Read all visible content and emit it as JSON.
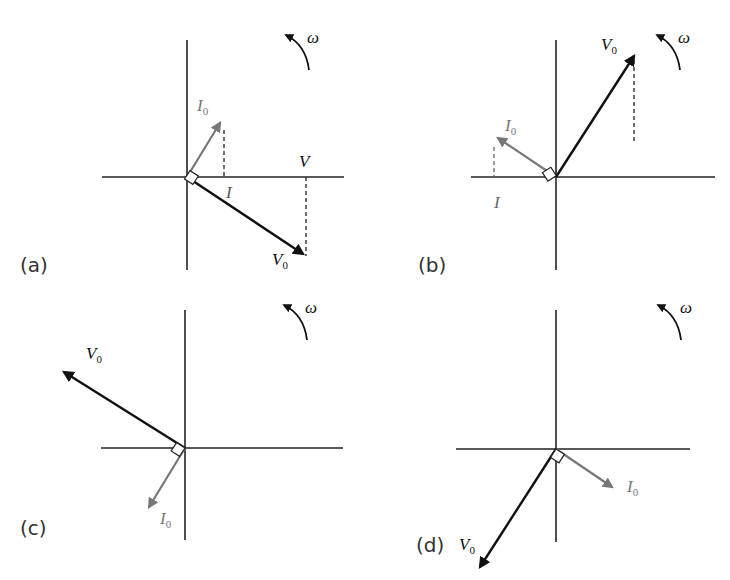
{
  "figure": {
    "colors": {
      "voltage": "#111111",
      "current": "#777777",
      "axis": "#222222"
    },
    "rotation_label": "ω",
    "panels": [
      {
        "id": "a",
        "label": "(a)",
        "V0_label": "V",
        "V0_sub": "0",
        "I0_label": "I",
        "I0_sub": "0",
        "projection_V_label": "V",
        "projection_I_label": "I"
      },
      {
        "id": "b",
        "label": "(b)",
        "V0_label": "V",
        "V0_sub": "0",
        "I0_label": "I",
        "I0_sub": "0",
        "projection_I_label": "I"
      },
      {
        "id": "c",
        "label": "(c)",
        "V0_label": "V",
        "V0_sub": "0",
        "I0_label": "I",
        "I0_sub": "0"
      },
      {
        "id": "d",
        "label": "(d)",
        "V0_label": "V",
        "V0_sub": "0",
        "I0_label": "I",
        "I0_sub": "0"
      }
    ]
  }
}
